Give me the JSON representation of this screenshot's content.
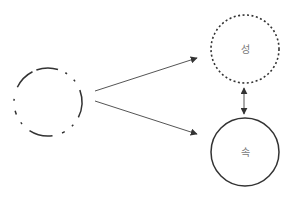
{
  "diagram": {
    "nodes": [
      {
        "id": "source",
        "label": "",
        "style": "dashed-broken",
        "cx": 48,
        "cy": 102,
        "r": 34
      },
      {
        "id": "seong",
        "label": "성",
        "style": "dotted",
        "cx": 245,
        "cy": 49,
        "r": 34
      },
      {
        "id": "sok",
        "label": "속",
        "style": "solid",
        "cx": 245,
        "cy": 152,
        "r": 34
      }
    ],
    "edges": [
      {
        "from": "source",
        "to": "seong",
        "type": "arrow"
      },
      {
        "from": "source",
        "to": "sok",
        "type": "arrow"
      },
      {
        "from": "seong",
        "to": "sok",
        "type": "double-arrow"
      }
    ],
    "colors": {
      "stroke": "#333333",
      "arrow": "#555555",
      "label": "#777777"
    }
  }
}
